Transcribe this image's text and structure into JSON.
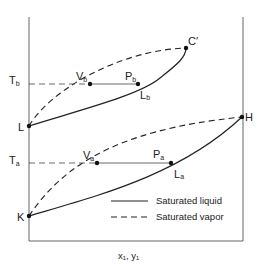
{
  "diagram": {
    "x_axis_label": "x₁, y₁",
    "y_axis_labels": {
      "Tb": {
        "main": "T",
        "sub": "b"
      },
      "Ta": {
        "main": "T",
        "sub": "a"
      }
    },
    "points": {
      "C_prime": "C′",
      "Vb": {
        "main": "V",
        "sub": "b"
      },
      "Pb": {
        "main": "P",
        "sub": "b"
      },
      "Lb": {
        "main": "L",
        "sub": "b"
      },
      "L": "L",
      "H": "H",
      "Va": {
        "main": "V",
        "sub": "a"
      },
      "Pa": {
        "main": "P",
        "sub": "a"
      },
      "La": {
        "main": "L",
        "sub": "a"
      },
      "K": "K"
    },
    "legend": [
      {
        "style": "solid",
        "label": "Saturated liquid"
      },
      {
        "style": "dashed",
        "label": "Saturated vapor"
      }
    ]
  }
}
